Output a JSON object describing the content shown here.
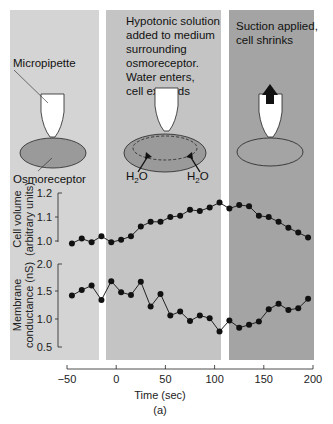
{
  "figure": {
    "panel_label": "(a)",
    "panels": [
      {
        "name": "control",
        "fill": "#d4d4d4"
      },
      {
        "name": "hypotonic",
        "fill": "#c4c4c4",
        "caption": [
          "Hypotonic solution",
          "added to medium",
          "surrounding",
          "osmoreceptor.",
          "Water enters,",
          "cell expands"
        ]
      },
      {
        "name": "suction",
        "fill": "#a4a4a4",
        "caption": [
          "Suction applied,",
          "cell shrinks"
        ]
      }
    ],
    "labels": {
      "micropipette": "Micropipette",
      "osmoreceptor": "Osmoreceptor",
      "water_left": "H2O",
      "water_right": "H2O"
    },
    "colors": {
      "cell_fill": "#9a9a9a",
      "pipette_fill": "#ffffff",
      "marker": "#111111"
    }
  },
  "chart_data": [
    {
      "type": "line",
      "title": "",
      "xlabel": "Time (sec)",
      "ylabel": "Cell volume (arbitrary units)",
      "xlim": [
        -50,
        200
      ],
      "ylim": [
        0.95,
        1.2
      ],
      "xticks": [
        -50,
        0,
        50,
        100,
        150,
        200
      ],
      "yticks": [
        1.0,
        1.1,
        1.2
      ],
      "grid": false,
      "series": [
        {
          "name": "Cell volume",
          "x": [
            -45,
            -35,
            -25,
            -15,
            -5,
            5,
            15,
            25,
            35,
            45,
            55,
            65,
            75,
            85,
            95,
            105,
            115,
            125,
            135,
            145,
            155,
            165,
            175,
            185,
            195
          ],
          "values": [
            0.99,
            1.01,
            0.995,
            1.02,
            0.995,
            1.005,
            1.02,
            1.06,
            1.08,
            1.08,
            1.1,
            1.105,
            1.13,
            1.125,
            1.14,
            1.16,
            1.135,
            1.15,
            1.145,
            1.105,
            1.1,
            1.08,
            1.055,
            1.035,
            1.015
          ]
        }
      ]
    },
    {
      "type": "line",
      "title": "",
      "xlabel": "Time (sec)",
      "ylabel": "Membrane conductance (nS)",
      "xlim": [
        -50,
        200
      ],
      "ylim": [
        0.5,
        2.0
      ],
      "xticks": [
        -50,
        0,
        50,
        100,
        150,
        200
      ],
      "yticks": [
        0.5,
        1.0,
        1.5,
        2.0
      ],
      "grid": false,
      "series": [
        {
          "name": "Membrane conductance",
          "x": [
            -45,
            -35,
            -25,
            -15,
            -5,
            5,
            15,
            25,
            35,
            45,
            55,
            65,
            75,
            85,
            95,
            105,
            115,
            125,
            135,
            145,
            155,
            165,
            175,
            185,
            195
          ],
          "values": [
            1.43,
            1.53,
            1.61,
            1.35,
            1.69,
            1.49,
            1.44,
            1.68,
            1.23,
            1.46,
            1.07,
            1.14,
            0.97,
            1.07,
            1.02,
            0.78,
            0.98,
            0.85,
            0.9,
            0.96,
            1.18,
            1.28,
            1.17,
            1.2,
            1.37
          ]
        }
      ]
    }
  ],
  "axes": {
    "top_ylabel": [
      "Cell volume",
      "(arbitrary units)"
    ],
    "top_yticks": [
      "1.2",
      "1.1",
      "1.0"
    ],
    "bottom_ylabel": [
      "Membrane",
      "conductance (nS)"
    ],
    "bottom_yticks": [
      "2.0",
      "1.5",
      "1.0",
      "0.5"
    ],
    "xticks": [
      "−50",
      "0",
      "50",
      "100",
      "150",
      "200"
    ],
    "xlabel": "Time (sec)"
  }
}
